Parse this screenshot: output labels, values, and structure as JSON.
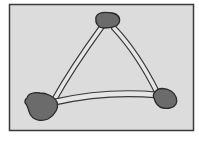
{
  "diagram": {
    "type": "graph",
    "colors": {
      "background": "#ffffff",
      "frame_fill": "#dcdcdc",
      "frame_stroke": "#3a3a3a",
      "node_fill": "#6b6b6b",
      "node_stroke": "#2a2a2a",
      "edge_fill": "#e6e6e6",
      "edge_stroke": "#3a3a3a"
    },
    "nodes": [
      {
        "id": "top",
        "x": 106,
        "y": 20
      },
      {
        "id": "bottom-left",
        "x": 40,
        "y": 104
      },
      {
        "id": "bottom-right",
        "x": 166,
        "y": 98
      }
    ],
    "edges": [
      {
        "from": "top",
        "to": "bottom-left"
      },
      {
        "from": "top",
        "to": "bottom-right"
      },
      {
        "from": "bottom-left",
        "to": "bottom-right"
      }
    ]
  }
}
